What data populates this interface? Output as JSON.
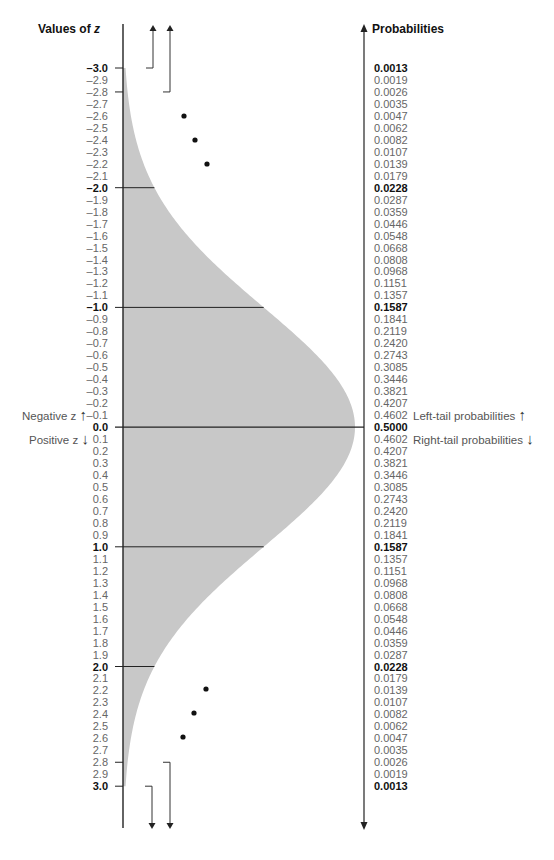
{
  "headers": {
    "left": "Values of ",
    "left_var": "z",
    "right": "Probabilities"
  },
  "side_labels": {
    "negative_z": "Negative z",
    "positive_z": "Positive z",
    "left_tail": "Left-tail probabilities",
    "right_tail": "Right-tail probabilities",
    "up_arrow": "↑",
    "down_arrow": "↓"
  },
  "colors": {
    "curve_fill": "#c8c8c8",
    "axis": "#222222",
    "text": "#666666",
    "bold_text": "#111111"
  },
  "chart_data": {
    "type": "table",
    "columns": [
      "z",
      "probability"
    ],
    "bold_rows": [
      "-3.0",
      "-2.0",
      "-1.0",
      "0.0",
      "1.0",
      "2.0",
      "3.0"
    ],
    "rows": [
      [
        "–3.0",
        "0.0013"
      ],
      [
        "–2.9",
        "0.0019"
      ],
      [
        "–2.8",
        "0.0026"
      ],
      [
        "–2.7",
        "0.0035"
      ],
      [
        "–2.6",
        "0.0047"
      ],
      [
        "–2.5",
        "0.0062"
      ],
      [
        "–2.4",
        "0.0082"
      ],
      [
        "–2.3",
        "0.0107"
      ],
      [
        "–2.2",
        "0.0139"
      ],
      [
        "–2.1",
        "0.0179"
      ],
      [
        "–2.0",
        "0.0228"
      ],
      [
        "–1.9",
        "0.0287"
      ],
      [
        "–1.8",
        "0.0359"
      ],
      [
        "–1.7",
        "0.0446"
      ],
      [
        "–1.6",
        "0.0548"
      ],
      [
        "–1.5",
        "0.0668"
      ],
      [
        "–1.4",
        "0.0808"
      ],
      [
        "–1.3",
        "0.0968"
      ],
      [
        "–1.2",
        "0.1151"
      ],
      [
        "–1.1",
        "0.1357"
      ],
      [
        "–1.0",
        "0.1587"
      ],
      [
        "–0.9",
        "0.1841"
      ],
      [
        "–0.8",
        "0.2119"
      ],
      [
        "–0.7",
        "0.2420"
      ],
      [
        "–0.6",
        "0.2743"
      ],
      [
        "–0.5",
        "0.3085"
      ],
      [
        "–0.4",
        "0.3446"
      ],
      [
        "–0.3",
        "0.3821"
      ],
      [
        "–0.2",
        "0.4207"
      ],
      [
        "–0.1",
        "0.4602"
      ],
      [
        "0.0",
        "0.5000"
      ],
      [
        "0.1",
        "0.4602"
      ],
      [
        "0.2",
        "0.4207"
      ],
      [
        "0.3",
        "0.3821"
      ],
      [
        "0.4",
        "0.3446"
      ],
      [
        "0.5",
        "0.3085"
      ],
      [
        "0.6",
        "0.2743"
      ],
      [
        "0.7",
        "0.2420"
      ],
      [
        "0.8",
        "0.2119"
      ],
      [
        "0.9",
        "0.1841"
      ],
      [
        "1.0",
        "0.1587"
      ],
      [
        "1.1",
        "0.1357"
      ],
      [
        "1.2",
        "0.1151"
      ],
      [
        "1.3",
        "0.0968"
      ],
      [
        "1.4",
        "0.0808"
      ],
      [
        "1.5",
        "0.0668"
      ],
      [
        "1.6",
        "0.0548"
      ],
      [
        "1.7",
        "0.0446"
      ],
      [
        "1.8",
        "0.0359"
      ],
      [
        "1.9",
        "0.0287"
      ],
      [
        "2.0",
        "0.0228"
      ],
      [
        "2.1",
        "0.0179"
      ],
      [
        "2.2",
        "0.0139"
      ],
      [
        "2.3",
        "0.0107"
      ],
      [
        "2.4",
        "0.0082"
      ],
      [
        "2.5",
        "0.0062"
      ],
      [
        "2.6",
        "0.0047"
      ],
      [
        "2.7",
        "0.0035"
      ],
      [
        "2.8",
        "0.0026"
      ],
      [
        "2.9",
        "0.0019"
      ],
      [
        "3.0",
        "0.0013"
      ]
    ],
    "annotations": {
      "negative_z": "Negative z ↑ (left tail)",
      "positive_z": "Positive z ↓ (right tail)",
      "left_tail": "Left-tail probabilities ↑",
      "right_tail": "Right-tail probabilities ↓"
    }
  }
}
